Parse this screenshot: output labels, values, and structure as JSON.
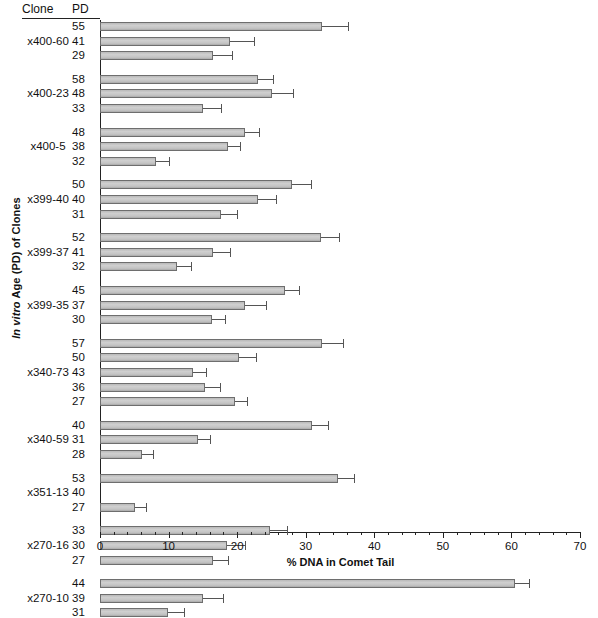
{
  "header": {
    "clone_col": "Clone",
    "pd_col": "PD"
  },
  "axes": {
    "ylabel_italic": "In vitro",
    "ylabel_rest": " Age (PD) of Clones",
    "xlabel": "% DNA in Comet Tail",
    "x_ticks": [
      0,
      10,
      20,
      30,
      40,
      50,
      60,
      70
    ],
    "x_minor_step": 2,
    "xlim": [
      0,
      70
    ]
  },
  "chart_data": {
    "type": "bar",
    "orientation": "horizontal",
    "title": "",
    "xlabel": "% DNA in Comet Tail",
    "ylabel": "In vitro Age (PD) of Clones",
    "xlim": [
      0,
      70
    ],
    "grid": false,
    "legend": "none",
    "error_bars": "one-sided (upper SEM)",
    "groups": [
      {
        "clone": "x400-60",
        "rows": [
          {
            "pd": "55",
            "value": 32.4,
            "error": 3.8
          },
          {
            "pd": "41",
            "value": 19.0,
            "error": 3.4
          },
          {
            "pd": "29",
            "value": 16.5,
            "error": 2.8
          }
        ]
      },
      {
        "clone": "x400-23",
        "rows": [
          {
            "pd": "58",
            "value": 23.0,
            "error": 2.2
          },
          {
            "pd": "48",
            "value": 25.1,
            "error": 3.0
          },
          {
            "pd": "33",
            "value": 15.0,
            "error": 2.6
          }
        ]
      },
      {
        "clone": "x400-5",
        "rows": [
          {
            "pd": "48",
            "value": 21.2,
            "error": 2.0
          },
          {
            "pd": "38",
            "value": 18.6,
            "error": 1.8
          },
          {
            "pd": "32",
            "value": 8.2,
            "error": 1.9
          }
        ]
      },
      {
        "clone": "x399-40",
        "rows": [
          {
            "pd": "50",
            "value": 28.0,
            "error": 2.8
          },
          {
            "pd": "40",
            "value": 23.1,
            "error": 2.6
          },
          {
            "pd": "31",
            "value": 17.6,
            "error": 2.4
          }
        ]
      },
      {
        "clone": "x399-37",
        "rows": [
          {
            "pd": "52",
            "value": 32.3,
            "error": 2.6
          },
          {
            "pd": "41",
            "value": 16.5,
            "error": 2.4
          },
          {
            "pd": "32",
            "value": 11.2,
            "error": 2.0
          }
        ]
      },
      {
        "clone": "x399-35",
        "rows": [
          {
            "pd": "45",
            "value": 27.0,
            "error": 2.0
          },
          {
            "pd": "37",
            "value": 21.2,
            "error": 3.0
          },
          {
            "pd": "30",
            "value": 16.3,
            "error": 1.9
          }
        ]
      },
      {
        "clone": "x340-73",
        "rows": [
          {
            "pd": "57",
            "value": 32.4,
            "error": 3.0
          },
          {
            "pd": "50",
            "value": 20.2,
            "error": 2.6
          },
          {
            "pd": "43",
            "value": 13.6,
            "error": 1.8
          },
          {
            "pd": "36",
            "value": 15.3,
            "error": 2.2
          },
          {
            "pd": "27",
            "value": 19.7,
            "error": 1.7
          }
        ]
      },
      {
        "clone": "x340-59",
        "rows": [
          {
            "pd": "40",
            "value": 30.9,
            "error": 2.4
          },
          {
            "pd": "31",
            "value": 14.3,
            "error": 1.8
          },
          {
            "pd": "28",
            "value": 6.1,
            "error": 1.6
          }
        ]
      },
      {
        "clone": "x351-13",
        "rows": [
          {
            "pd": "53",
            "value": 34.7,
            "error": 2.4
          },
          {
            "pd": "40",
            "value": 0.0,
            "error": 0.0
          },
          {
            "pd": "27",
            "value": 5.1,
            "error": 1.6
          }
        ]
      },
      {
        "clone": "x270-16",
        "rows": [
          {
            "pd": "33",
            "value": 24.8,
            "error": 2.4
          },
          {
            "pd": "30",
            "value": 18.5,
            "error": 2.6
          },
          {
            "pd": "27",
            "value": 16.5,
            "error": 2.2
          }
        ]
      },
      {
        "clone": "x270-10",
        "rows": [
          {
            "pd": "44",
            "value": 60.5,
            "error": 2.1
          },
          {
            "pd": "39",
            "value": 15.0,
            "error": 3.0
          },
          {
            "pd": "31",
            "value": 9.9,
            "error": 2.4
          }
        ]
      }
    ]
  }
}
